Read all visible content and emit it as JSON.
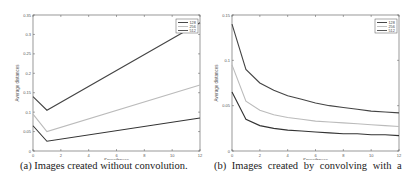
{
  "chart_data": [
    {
      "type": "line",
      "title": "",
      "xlabel": "Smoothness",
      "ylabel": "Average distances",
      "xlim": [
        0,
        12
      ],
      "ylim": [
        0,
        0.35
      ],
      "xticks": [
        "0",
        "2",
        "4",
        "6",
        "8",
        "10",
        "12"
      ],
      "yticks": [
        "0",
        "0.05",
        "0.1",
        "0.15",
        "0.2",
        "0.25",
        "0.3",
        "0.35"
      ],
      "legend_position": "upper right",
      "grid": false,
      "x": [
        0,
        1,
        12
      ],
      "series": [
        {
          "name": "128",
          "color": "#333333",
          "values": [
            0.065,
            0.025,
            0.085
          ]
        },
        {
          "name": "256",
          "color": "#bbbbbb",
          "values": [
            0.095,
            0.05,
            0.17
          ]
        },
        {
          "name": "512",
          "color": "#444444",
          "values": [
            0.14,
            0.105,
            0.33
          ]
        }
      ],
      "caption": "(a)  Images created without convolution."
    },
    {
      "type": "line",
      "title": "",
      "xlabel": "Smoothness",
      "ylabel": "Average distances",
      "xlim": [
        0,
        12
      ],
      "ylim": [
        0,
        0.15
      ],
      "xticks": [
        "0",
        "2",
        "4",
        "6",
        "8",
        "10",
        "12"
      ],
      "yticks": [
        "0",
        "0.05",
        "0.1",
        "0.15"
      ],
      "legend_position": "upper right",
      "grid": false,
      "x": [
        0,
        1,
        2,
        3,
        4,
        5,
        6,
        7,
        8,
        9,
        10,
        11,
        12
      ],
      "series": [
        {
          "name": "128",
          "color": "#333333",
          "values": [
            0.065,
            0.035,
            0.028,
            0.025,
            0.023,
            0.022,
            0.021,
            0.02,
            0.019,
            0.019,
            0.018,
            0.018,
            0.017
          ]
        },
        {
          "name": "256",
          "color": "#bbbbbb",
          "values": [
            0.095,
            0.055,
            0.045,
            0.04,
            0.037,
            0.035,
            0.033,
            0.032,
            0.031,
            0.03,
            0.029,
            0.028,
            0.027
          ]
        },
        {
          "name": "512",
          "color": "#444444",
          "values": [
            0.14,
            0.09,
            0.075,
            0.067,
            0.061,
            0.057,
            0.053,
            0.05,
            0.048,
            0.046,
            0.044,
            0.043,
            0.042
          ]
        }
      ],
      "caption": "(b)  Images created by convolving with a"
    }
  ]
}
